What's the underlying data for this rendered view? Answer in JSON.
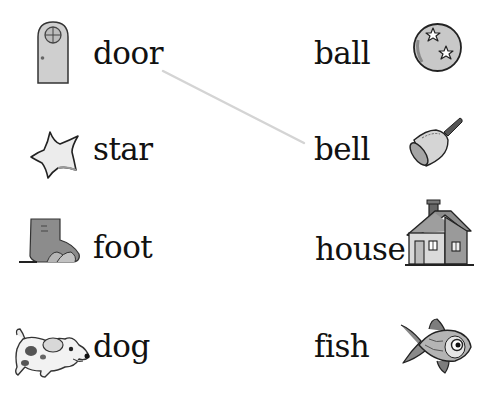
{
  "worksheet": {
    "left_column": [
      {
        "word": "door",
        "icon": "door-icon"
      },
      {
        "word": "star",
        "icon": "star-icon"
      },
      {
        "word": "foot",
        "icon": "foot-icon"
      },
      {
        "word": "dog",
        "icon": "dog-icon"
      }
    ],
    "right_column": [
      {
        "word": "ball",
        "icon": "ball-icon"
      },
      {
        "word": "bell",
        "icon": "bell-icon"
      },
      {
        "word": "house",
        "icon": "house-icon"
      },
      {
        "word": "fish",
        "icon": "fish-icon"
      }
    ],
    "matches": [
      {
        "from": "door",
        "to": "bell",
        "x1": 163,
        "y1": 71,
        "x2": 304,
        "y2": 143,
        "color": "#d4d4d4"
      }
    ]
  },
  "colors": {
    "text": "#111111",
    "icon_fill": "#c8c8c8",
    "icon_dark": "#8a8a8a",
    "outline": "#222222",
    "line": "#d4d4d4"
  }
}
